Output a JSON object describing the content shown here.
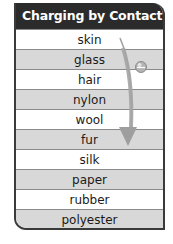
{
  "table": {
    "title": "Charging by Contact",
    "rows": [
      "skin",
      "glass",
      "hair",
      "nylon",
      "wool",
      "fur",
      "silk",
      "paper",
      "rubber",
      "polyester"
    ],
    "shading": [
      false,
      true,
      false,
      true,
      false,
      true,
      false,
      true,
      false,
      true
    ]
  },
  "diagram": {
    "arrow": {
      "direction": "down",
      "color": "#9a9a9a",
      "meaning": "series order"
    },
    "charge_ball": {
      "sign": "negative",
      "symbol": "−",
      "color": "#a8a8a8"
    }
  }
}
